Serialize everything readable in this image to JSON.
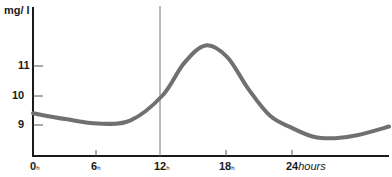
{
  "chart_data": {
    "type": "line",
    "title": "",
    "ylabel": "mg/l",
    "xlabel": "hours",
    "ylim": [
      8.0,
      12.3
    ],
    "xlim": [
      0,
      34
    ],
    "y_ticks": [
      9,
      10,
      11
    ],
    "y_tick_labels": [
      "9",
      "10",
      "11"
    ],
    "x_ticks": [
      0,
      6,
      12,
      18,
      24
    ],
    "x_tick_labels": [
      "0h",
      "6h",
      "12h",
      "18h",
      "24 hours"
    ],
    "annotations": [
      {
        "type": "vertical-line",
        "x": 12
      }
    ],
    "grid": false,
    "legend": null,
    "series": [
      {
        "name": "concentration",
        "color": "#707070",
        "x": [
          0,
          3,
          6,
          9,
          12,
          14,
          16,
          18,
          20,
          22,
          24,
          26,
          28,
          30,
          33
        ],
        "values": [
          9.4,
          9.2,
          9.05,
          9.15,
          10.0,
          11.1,
          11.7,
          11.3,
          10.2,
          9.3,
          8.9,
          8.6,
          8.55,
          8.65,
          8.95
        ]
      }
    ]
  },
  "labels": {
    "y_unit": "mg/ l",
    "y11": "11",
    "y10": "10",
    "y9": "9",
    "x0": "0",
    "x6": "6",
    "x12": "12",
    "x18": "18",
    "x24": "24",
    "x_unit": "hours",
    "h": "h"
  }
}
